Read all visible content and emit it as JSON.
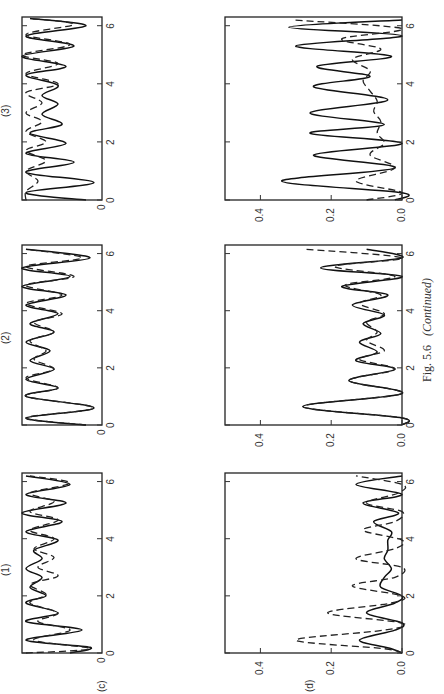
{
  "figure": {
    "caption_number": "Fig. 5.6",
    "caption_note": "(Continued)",
    "orientation": "rotated 90° counter-clockwise on page",
    "columns": [
      "(1)",
      "(2)",
      "(3)"
    ],
    "rows": [
      "(c)",
      "(d)"
    ]
  },
  "axes": {
    "x_ticks": [
      "0",
      "2",
      "4",
      "6"
    ],
    "x_tick_values": [
      0,
      2,
      4,
      6
    ],
    "x_range": [
      0,
      6.3
    ],
    "row_c_y_tick": "0",
    "row_d_y_ticks": [
      "0.0",
      "0.2",
      "0.4"
    ],
    "row_d_y_tick_values": [
      0.0,
      0.2,
      0.4
    ],
    "row_d_y_range": [
      0,
      0.5
    ]
  },
  "chart_data": [
    {
      "type": "line",
      "panel": "(c)(1)",
      "xlabel": "",
      "ylabel": "",
      "xlim": [
        0,
        6.3
      ],
      "ylim": [
        0,
        1
      ],
      "series": [
        {
          "name": "solid",
          "x": [
            0,
            0.2,
            0.45,
            0.8,
            1.1,
            1.4,
            1.75,
            2.0,
            2.3,
            2.65,
            2.95,
            3.3,
            3.6,
            3.95,
            4.25,
            4.6,
            4.9,
            5.25,
            5.55,
            5.9,
            6.2
          ],
          "y": [
            0.4,
            0.15,
            0.95,
            0.25,
            0.95,
            0.55,
            0.95,
            0.7,
            0.9,
            0.75,
            0.95,
            0.75,
            0.85,
            0.55,
            0.95,
            0.5,
            1.0,
            0.45,
            0.95,
            0.4,
            0.95
          ]
        },
        {
          "name": "dashed",
          "x": [
            0,
            0.15,
            0.45,
            0.8,
            1.1,
            1.4,
            1.75,
            2.05,
            2.4,
            2.7,
            3.0,
            3.35,
            3.65,
            4.0,
            4.3,
            4.65,
            4.95,
            5.3,
            5.6,
            5.95,
            6.2
          ],
          "y": [
            0.95,
            0.15,
            0.85,
            0.4,
            0.8,
            0.55,
            0.9,
            0.7,
            0.9,
            0.55,
            0.8,
            0.6,
            0.85,
            0.6,
            0.9,
            0.55,
            0.9,
            0.6,
            0.9,
            0.4,
            0.9
          ]
        }
      ]
    },
    {
      "type": "line",
      "panel": "(c)(2)",
      "xlim": [
        0,
        6.3
      ],
      "ylim": [
        0,
        1
      ],
      "series": [
        {
          "name": "solid",
          "x": [
            0,
            0.25,
            0.6,
            1.0,
            1.3,
            1.6,
            1.95,
            2.25,
            2.6,
            2.9,
            3.25,
            3.55,
            3.9,
            4.2,
            4.55,
            4.85,
            5.2,
            5.5,
            5.85,
            6.15
          ],
          "y": [
            0.2,
            0.95,
            0.1,
            0.95,
            0.55,
            0.95,
            0.6,
            0.9,
            0.65,
            0.95,
            0.6,
            0.9,
            0.55,
            0.95,
            0.45,
            1.0,
            0.4,
            1.0,
            0.15,
            0.95
          ]
        },
        {
          "name": "dashed",
          "x": [
            0,
            0.25,
            0.6,
            1.0,
            1.3,
            1.65,
            1.95,
            2.3,
            2.6,
            2.95,
            3.25,
            3.6,
            3.9,
            4.25,
            4.55,
            4.9,
            5.2,
            5.55,
            5.85,
            6.15
          ],
          "y": [
            0.2,
            0.95,
            0.1,
            0.95,
            0.55,
            0.95,
            0.6,
            0.85,
            0.7,
            0.9,
            0.6,
            0.85,
            0.5,
            0.95,
            0.5,
            0.95,
            0.35,
            0.95,
            0.25,
            0.95
          ]
        }
      ]
    },
    {
      "type": "line",
      "panel": "(c)(3)",
      "xlim": [
        0,
        6.3
      ],
      "ylim": [
        0,
        1
      ],
      "series": [
        {
          "name": "solid",
          "x": [
            0,
            0.25,
            0.6,
            0.95,
            1.3,
            1.6,
            1.95,
            2.3,
            2.6,
            2.95,
            3.3,
            3.6,
            3.95,
            4.3,
            4.6,
            4.95,
            5.3,
            5.65,
            6.0,
            6.25
          ],
          "y": [
            0.2,
            0.95,
            0.1,
            0.95,
            0.35,
            0.95,
            0.45,
            0.9,
            0.5,
            0.75,
            0.55,
            0.75,
            0.55,
            0.95,
            0.45,
            1.0,
            0.35,
            0.95,
            0.2,
            0.9
          ]
        },
        {
          "name": "dashed",
          "x": [
            0,
            0.3,
            0.65,
            1.0,
            1.35,
            1.7,
            2.0,
            2.35,
            2.7,
            3.0,
            3.35,
            3.7,
            4.0,
            4.35,
            4.7,
            5.0,
            5.35,
            5.7,
            6.05,
            6.25
          ],
          "y": [
            0.95,
            0.95,
            0.8,
            0.95,
            0.7,
            0.95,
            0.7,
            0.95,
            0.75,
            0.95,
            0.75,
            0.95,
            0.55,
            0.95,
            0.55,
            1.0,
            0.4,
            0.95,
            0.35,
            0.9
          ]
        }
      ]
    },
    {
      "type": "line",
      "panel": "(d)(1)",
      "xlim": [
        0,
        6.3
      ],
      "ylim": [
        0,
        0.5
      ],
      "y_ticks": [
        0.0,
        0.2,
        0.4
      ],
      "series": [
        {
          "name": "solid",
          "x": [
            0,
            0.15,
            0.45,
            0.8,
            1.05,
            1.4,
            1.75,
            2.0,
            2.3,
            2.65,
            2.95,
            3.3,
            3.6,
            3.95,
            4.25,
            4.6,
            4.9,
            5.25,
            5.55,
            5.9,
            6.2
          ],
          "y": [
            0.0,
            0.03,
            0.12,
            0.02,
            0.0,
            0.1,
            0.02,
            0.0,
            0.06,
            0.05,
            0.03,
            0.05,
            0.04,
            0.04,
            0.03,
            0.08,
            0.01,
            0.11,
            0.0,
            0.13,
            0.0
          ]
        },
        {
          "name": "dashed",
          "x": [
            0,
            0.15,
            0.45,
            0.8,
            1.05,
            1.4,
            1.75,
            2.0,
            2.35,
            2.65,
            3.0,
            3.3,
            3.65,
            3.95,
            4.3,
            4.6,
            4.95,
            5.25,
            5.6,
            5.9,
            6.2
          ],
          "y": [
            0.0,
            0.05,
            0.3,
            0.05,
            0.0,
            0.21,
            0.03,
            0.0,
            0.14,
            0.02,
            0.0,
            0.13,
            0.02,
            0.0,
            0.11,
            0.02,
            0.0,
            0.1,
            0.01,
            0.0,
            0.13
          ]
        }
      ]
    },
    {
      "type": "line",
      "panel": "(d)(2)",
      "xlim": [
        0,
        6.3
      ],
      "ylim": [
        0,
        0.5
      ],
      "y_ticks": [
        0.0,
        0.2,
        0.4
      ],
      "series": [
        {
          "name": "solid",
          "x": [
            0,
            0.25,
            0.65,
            1.1,
            1.55,
            1.95,
            2.25,
            2.55,
            2.9,
            3.2,
            3.55,
            3.85,
            4.2,
            4.55,
            4.85,
            5.2,
            5.5,
            5.85,
            6.15
          ],
          "y": [
            0.0,
            0.0,
            0.28,
            0.0,
            0.15,
            0.02,
            0.13,
            0.07,
            0.12,
            0.06,
            0.11,
            0.05,
            0.14,
            0.04,
            0.17,
            0.0,
            0.23,
            0.0,
            0.1
          ]
        },
        {
          "name": "dashed",
          "x": [
            0,
            0.25,
            0.65,
            1.1,
            1.55,
            1.95,
            2.3,
            2.6,
            2.95,
            3.25,
            3.6,
            3.9,
            4.25,
            4.55,
            4.9,
            5.2,
            5.55,
            5.85,
            6.15
          ],
          "y": [
            0.0,
            0.0,
            0.28,
            0.0,
            0.15,
            0.02,
            0.12,
            0.05,
            0.1,
            0.07,
            0.1,
            0.05,
            0.12,
            0.06,
            0.16,
            0.02,
            0.19,
            0.0,
            0.27
          ]
        }
      ]
    },
    {
      "type": "line",
      "panel": "(d)(3)",
      "xlim": [
        0,
        6.3
      ],
      "ylim": [
        0,
        0.5
      ],
      "y_ticks": [
        0.0,
        0.2,
        0.4
      ],
      "series": [
        {
          "name": "solid",
          "x": [
            0,
            0.25,
            0.65,
            1.1,
            1.55,
            1.95,
            2.3,
            2.6,
            3.0,
            3.45,
            3.9,
            4.25,
            4.6,
            4.95,
            5.3,
            5.65,
            5.95,
            6.2
          ],
          "y": [
            0.02,
            0.0,
            0.34,
            0.02,
            0.25,
            0.0,
            0.26,
            0.05,
            0.26,
            0.04,
            0.25,
            0.09,
            0.24,
            0.03,
            0.3,
            0.0,
            0.32,
            0.0
          ]
        },
        {
          "name": "dashed",
          "x": [
            0,
            0.25,
            0.65,
            1.1,
            1.55,
            1.95,
            2.3,
            2.7,
            3.05,
            3.4,
            3.75,
            4.1,
            4.45,
            4.85,
            5.2,
            5.55,
            5.9,
            6.2
          ],
          "y": [
            0.1,
            0.0,
            0.13,
            0.02,
            0.09,
            0.05,
            0.07,
            0.06,
            0.08,
            0.07,
            0.09,
            0.11,
            0.09,
            0.14,
            0.06,
            0.17,
            0.0,
            0.31
          ]
        }
      ]
    }
  ]
}
